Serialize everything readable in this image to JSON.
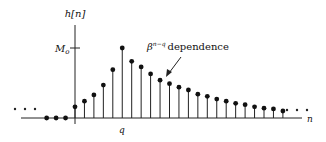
{
  "figure": {
    "y_axis_label": "h[n]",
    "x_axis_label": "n",
    "tick_label_M": "M",
    "tick_label_M_sub": "o",
    "peak_label": "q",
    "annotation_base": "β",
    "annotation_exp": "n−q",
    "annotation_text": "dependence",
    "ellipsis": "· · ·"
  },
  "chart_data": {
    "type": "stem",
    "title": "",
    "xlabel": "n",
    "ylabel": "h[n]",
    "annotations": [
      "M_o",
      "q",
      "β^{n−q} dependence"
    ],
    "x_index": [
      -3,
      -2,
      -1,
      0,
      1,
      2,
      3,
      4,
      5,
      6,
      7,
      8,
      9,
      10,
      11,
      12,
      13,
      14,
      15,
      16,
      17,
      18,
      19,
      20,
      21,
      22
    ],
    "values": [
      0,
      0,
      0,
      0.16,
      0.24,
      0.33,
      0.47,
      0.69,
      1.0,
      0.81,
      0.73,
      0.63,
      0.54,
      0.49,
      0.44,
      0.4,
      0.34,
      0.31,
      0.27,
      0.24,
      0.21,
      0.19,
      0.16,
      0.14,
      0.13,
      0.1
    ],
    "peak_index": 5,
    "peak_value_label": "M_o",
    "continues_left": true,
    "continues_right": true
  }
}
